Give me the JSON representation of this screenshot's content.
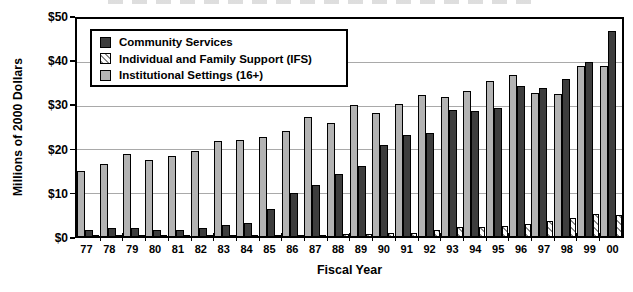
{
  "chart_data": {
    "type": "bar",
    "xlabel": "Fiscal Year",
    "ylabel": "Millions of 2000 Dollars",
    "ylim": [
      0,
      50
    ],
    "y_ticks": [
      "$50",
      "$40",
      "$30",
      "$20",
      "$10",
      "$0"
    ],
    "grid": "horizontal-gridlines-every-10",
    "legend_position": "top-left-inside",
    "categories": [
      "77",
      "78",
      "79",
      "80",
      "81",
      "82",
      "83",
      "84",
      "85",
      "86",
      "87",
      "88",
      "89",
      "90",
      "91",
      "92",
      "93",
      "94",
      "95",
      "96",
      "97",
      "98",
      "99",
      "00"
    ],
    "bar_order_left_to_right": [
      "Institutional Settings (16+)",
      "Community Services",
      "Individual and Family Support (IFS)"
    ],
    "series": [
      {
        "name": "Institutional Settings (16+)",
        "key": "institutional",
        "swatch": "gray",
        "color": "#b3b3b3",
        "values": [
          15.0,
          16.5,
          19.0,
          17.6,
          18.5,
          19.6,
          21.8,
          22.2,
          22.8,
          24.2,
          27.4,
          26.0,
          30.2,
          28.3,
          30.5,
          32.4,
          32.0,
          33.5,
          35.8,
          37.0,
          33.0,
          32.7,
          39.2,
          39.2
        ]
      },
      {
        "name": "Community Services",
        "key": "community",
        "swatch": "dark",
        "color": "#3d3d3d",
        "values": [
          1.5,
          1.8,
          1.8,
          1.5,
          1.5,
          1.8,
          2.6,
          3.0,
          6.2,
          10.0,
          11.8,
          14.4,
          16.2,
          21.0,
          23.2,
          23.8,
          29.0,
          28.8,
          29.5,
          34.5,
          34.0,
          36.2,
          40.0,
          47.2
        ]
      },
      {
        "name": "Individual and Family Support (IFS)",
        "key": "ifs",
        "swatch": "hatch",
        "color": "hatched-diagonal",
        "values": [
          0.2,
          0.2,
          0.2,
          0.2,
          0.2,
          0.2,
          0.2,
          0.2,
          0.2,
          0.2,
          0.3,
          0.4,
          0.5,
          0.8,
          0.8,
          1.5,
          2.0,
          2.0,
          2.3,
          2.7,
          3.5,
          4.2,
          5.0,
          4.8
        ]
      }
    ],
    "legend": {
      "entries": [
        {
          "label": "Community Services",
          "swatch": "dark"
        },
        {
          "label": "Individual and Family Support (IFS)",
          "swatch": "hatch"
        },
        {
          "label": "Institutional Settings (16+)",
          "swatch": "gray"
        }
      ]
    }
  },
  "colors": {
    "institutional_bar": "#b3b3b3",
    "community_bar": "#3d3d3d",
    "hatch_line": "#8a8a8a",
    "frame": "#000000",
    "gridline": "#a9a9a9",
    "background": "#ffffff"
  }
}
